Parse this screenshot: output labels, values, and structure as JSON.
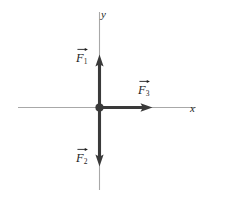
{
  "figure": {
    "kind": "force-vector-diagram",
    "background_color": "#ffffff",
    "width": 226,
    "height": 197
  },
  "axes": {
    "color": "#a8a8a8",
    "origin": {
      "x": 99,
      "y": 107,
      "dot_color": "#3a3a3a"
    },
    "x_axis": {
      "label": "x",
      "label_x": 190,
      "label_y": 103,
      "x_start": 18,
      "x_end": 196,
      "y": 107
    },
    "y_axis": {
      "label": "y",
      "label_x": 101,
      "label_y": 9,
      "y_start": 12,
      "y_end": 190,
      "x": 99
    }
  },
  "vectors": [
    {
      "id": "F1",
      "symbol": "F",
      "subscript": "1",
      "direction": "up",
      "color": "#3a3a3a",
      "tail": {
        "x": 99,
        "y": 107
      },
      "tip": {
        "x": 99,
        "y": 55
      },
      "label_x": 76,
      "label_y": 52
    },
    {
      "id": "F2",
      "symbol": "F",
      "subscript": "2",
      "direction": "down",
      "color": "#3a3a3a",
      "tail": {
        "x": 99,
        "y": 107
      },
      "tip": {
        "x": 99,
        "y": 166
      },
      "label_x": 76,
      "label_y": 152
    },
    {
      "id": "F3",
      "symbol": "F",
      "subscript": "3",
      "direction": "right",
      "color": "#3a3a3a",
      "tail": {
        "x": 99,
        "y": 107
      },
      "tip": {
        "x": 152,
        "y": 107
      },
      "label_x": 138,
      "label_y": 84
    }
  ]
}
